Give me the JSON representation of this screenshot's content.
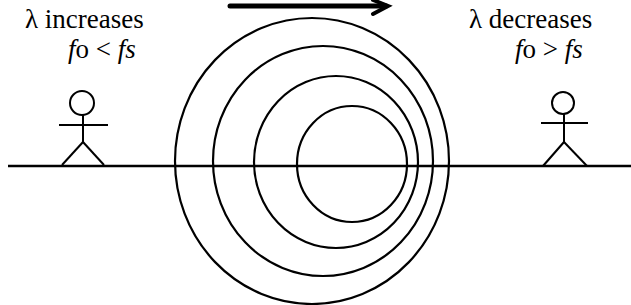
{
  "diagram": {
    "motion_arrow": {
      "direction": "right",
      "x1": 230,
      "x2": 388,
      "y": 6
    },
    "ground_line": {
      "x1": 8,
      "x2": 631,
      "y": 166
    },
    "wavefronts": [
      {
        "cx": 312,
        "cy": 161,
        "rx": 137,
        "ry": 143
      },
      {
        "cx": 323,
        "cy": 161,
        "rx": 110,
        "ry": 115
      },
      {
        "cx": 336,
        "cy": 162,
        "rx": 82,
        "ry": 86
      },
      {
        "cx": 352,
        "cy": 164,
        "rx": 55,
        "ry": 58
      }
    ],
    "left_observer": {
      "title_symbol": "λ",
      "title_text": " increases",
      "formula_f": "f",
      "formula_o": "o",
      "formula_op": " < ",
      "formula_rhs": "fs"
    },
    "right_observer": {
      "title_symbol": "λ",
      "title_text": " decreases",
      "formula_f": "f",
      "formula_o": "o",
      "formula_op": " > ",
      "formula_rhs": "fs"
    },
    "colors": {
      "stroke": "#000000",
      "background": "#ffffff"
    }
  }
}
